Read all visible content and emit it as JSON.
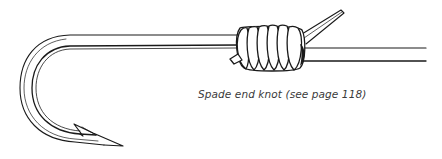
{
  "figure": {
    "caption": "Spade end knot (see page 118)",
    "parts": [
      "hook",
      "fishing-line",
      "knot-wraps",
      "tag-end",
      "barb"
    ],
    "colors": {
      "ink": "#1a1a1a",
      "background": "#ffffff",
      "caption": "#3a3a3a"
    }
  }
}
